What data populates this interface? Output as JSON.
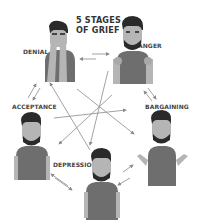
{
  "diagram": {
    "title_line1": "5 STAGES",
    "title_line2": "OF GRIEF",
    "stages": [
      {
        "id": "denial",
        "label": "DENIAL"
      },
      {
        "id": "anger",
        "label": "ANGER"
      },
      {
        "id": "bargaining",
        "label": "BARGAINING"
      },
      {
        "id": "depression",
        "label": "DEPRESSION"
      },
      {
        "id": "acceptance",
        "label": "ACCEPTANCE"
      }
    ],
    "colors": {
      "skin": "#b5b5b5",
      "hair": "#2a2a2a",
      "shirt": "#6e6e6e",
      "arrow": "#8a8a8a",
      "text": "#333333"
    }
  }
}
